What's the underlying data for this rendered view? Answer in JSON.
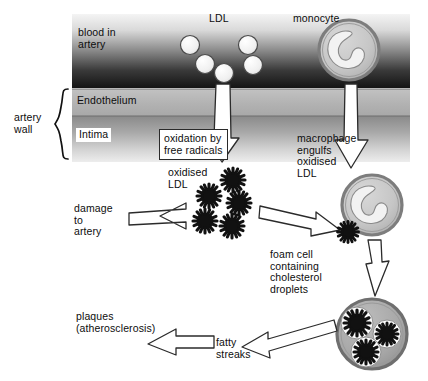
{
  "diagram": {
    "background_color": "#ffffff"
  },
  "artery": {
    "bracket_label_line1": "artery",
    "bracket_label_line2": "wall",
    "layers": [
      {
        "name": "blood-in-artery",
        "label_line1": "blood in",
        "label_line2": "artery",
        "top": 14,
        "height": 74,
        "gradient_from": "#f2f2f2",
        "gradient_to": "#1b1b1b"
      },
      {
        "name": "endothelium",
        "label": "Endothelium",
        "top": 88,
        "height": 28,
        "color": "#b4b4b4"
      },
      {
        "name": "intima",
        "label": "Intima",
        "top": 116,
        "height": 46,
        "gradient_from": "#8f8f8f",
        "gradient_to": "#e8e8e8"
      }
    ],
    "left": 72,
    "right": 410
  },
  "labels": {
    "ldl": "LDL",
    "monocyte": "monocyte",
    "oxidation_box_line1": "oxidation by",
    "oxidation_box_line2": "free radicals",
    "oxidised_ldl_line1": "oxidised",
    "oxidised_ldl_line2": "LDL",
    "macrophage_line1": "macrophage",
    "macrophage_line2": "engulfs",
    "macrophage_line3": "oxidised",
    "macrophage_line4": "LDL",
    "damage_line1": "damage",
    "damage_line2": "to",
    "damage_line3": "artery",
    "foam_cell_line1": "foam cell",
    "foam_cell_line2": "containing",
    "foam_cell_line3": "cholesterol",
    "foam_cell_line4": "droplets",
    "fatty_streaks_line1": "fatty",
    "fatty_streaks_line2": "streaks",
    "plaques_line1": "plaques",
    "plaques_line2": "(atherosclerosis)"
  },
  "particles": {
    "ldl_circles": [
      {
        "cx": 190,
        "cy": 45,
        "r": 9
      },
      {
        "cx": 204,
        "cy": 63,
        "r": 9
      },
      {
        "cx": 222,
        "cy": 72,
        "r": 9
      },
      {
        "cx": 247,
        "cy": 45,
        "r": 9
      },
      {
        "cx": 252,
        "cy": 64,
        "r": 9
      }
    ],
    "ldl_fill": "#efefef",
    "ldl_stroke": "#3a3a3a",
    "oxidised_ldl_cluster": [
      {
        "cx": 233,
        "cy": 180,
        "r": 11
      },
      {
        "cx": 209,
        "cy": 196,
        "r": 11
      },
      {
        "cx": 238,
        "cy": 203,
        "r": 11
      },
      {
        "cx": 205,
        "cy": 221,
        "r": 11
      },
      {
        "cx": 232,
        "cy": 226,
        "r": 11
      }
    ],
    "oxidised_fill": "#111111",
    "macrophage_particle": {
      "cx": 348,
      "cy": 232,
      "r": 10
    },
    "foam_cell_particles": [
      {
        "cx": 357,
        "cy": 324,
        "r": 13
      },
      {
        "cx": 385,
        "cy": 334,
        "r": 11
      },
      {
        "cx": 366,
        "cy": 351,
        "r": 12
      }
    ]
  },
  "cells": {
    "monocyte": {
      "cx": 349,
      "cy": 50,
      "r": 30,
      "membrane_color": "#8d8d8d",
      "cytoplasm_color": "#c8c8c8",
      "nucleus_color": "#efefef"
    },
    "macrophage": {
      "cx": 372,
      "cy": 205,
      "r": 30,
      "membrane_color": "#8d8d8d",
      "cytoplasm_color": "#c8c8c8",
      "nucleus_color": "#efefef"
    },
    "foam_cell": {
      "cx": 372,
      "cy": 334,
      "r": 35,
      "membrane_color": "#8d8d8d",
      "cytoplasm_color": "#aaaaaa",
      "vacuole_color": "#fdfdfd"
    }
  },
  "arrows": {
    "stroke": "#2a2a2a",
    "fill": "#ffffff",
    "list": [
      {
        "name": "ldl-down-arrow",
        "direction": "down"
      },
      {
        "name": "monocyte-down-arrow",
        "direction": "down"
      },
      {
        "name": "damage-to-artery-arrow",
        "direction": "left"
      },
      {
        "name": "oxidised-to-macrophage-arrow",
        "direction": "right"
      },
      {
        "name": "macrophage-to-foam-arrow",
        "direction": "down"
      },
      {
        "name": "foam-to-fatty-streaks-arrow",
        "direction": "left"
      },
      {
        "name": "fatty-streaks-to-plaques-arrow",
        "direction": "left"
      }
    ]
  }
}
